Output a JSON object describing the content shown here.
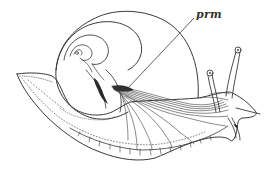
{
  "figure": {
    "labels": [
      {
        "id": "prm",
        "text": "prm"
      }
    ],
    "colors": {
      "ink": "#3a3a3a",
      "background": "#ffffff"
    }
  }
}
